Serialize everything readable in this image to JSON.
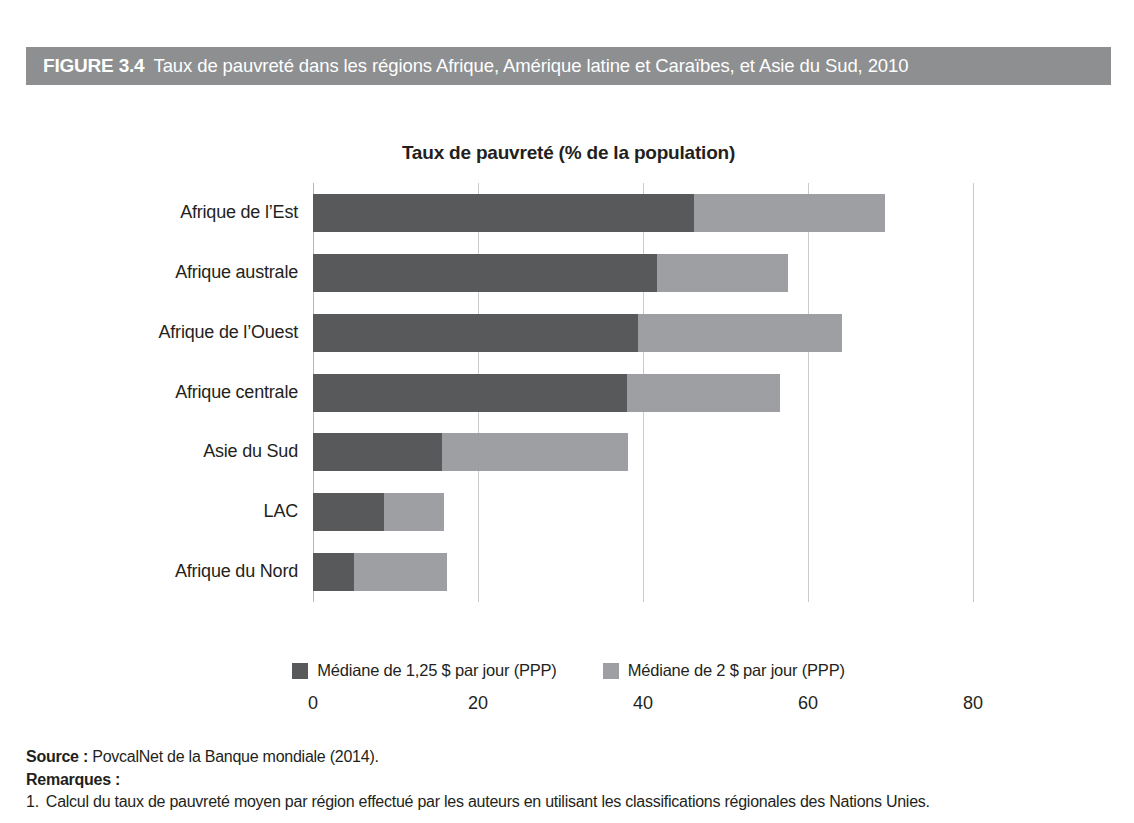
{
  "figure": {
    "number": "FIGURE 3.4",
    "title": "Taux de pauvreté dans les régions Afrique, Amérique latine et Caraïbes, et Asie du Sud, 2010",
    "header_bg": "#8d8f91"
  },
  "chart_data": {
    "type": "bar",
    "orientation": "horizontal",
    "stacked": true,
    "title": "Taux de pauvreté (% de la population)",
    "xlabel": "",
    "ylabel": "",
    "xlim": [
      0,
      80
    ],
    "xticks": [
      "0",
      "20",
      "40",
      "60",
      "80"
    ],
    "grid": "vertical",
    "legend_position": "bottom",
    "categories": [
      "Afrique de l’Est",
      "Afrique australe",
      "Afrique de l’Ouest",
      "Afrique centrale",
      "Asie du Sud",
      "LAC",
      "Afrique du Nord"
    ],
    "series": [
      {
        "name": "Médiane de 1,25 $ par jour (PPP)",
        "color": "#58595b",
        "values": [
          46.2,
          41.7,
          39.4,
          38.1,
          15.6,
          8.6,
          5.0
        ]
      },
      {
        "name": "Médiane de 2 $ par jour (PPP)",
        "color": "#9d9fa2",
        "values": [
          23.1,
          15.9,
          24.7,
          18.5,
          22.6,
          7.3,
          11.2
        ]
      }
    ],
    "totals": [
      69.3,
      57.6,
      64.1,
      56.6,
      38.2,
      15.9,
      16.2
    ]
  },
  "footer": {
    "source_label": "Source :",
    "source_text": "PovcalNet de la Banque mondiale (2014).",
    "remarks_label": "Remarques :",
    "notes": [
      {
        "number": "1.",
        "text": "Calcul du taux de pauvreté moyen par région effectué par les auteurs en utilisant les classifications régionales des Nations Unies."
      }
    ]
  }
}
